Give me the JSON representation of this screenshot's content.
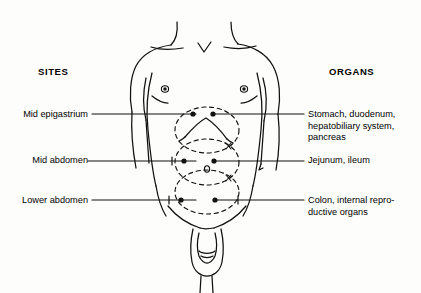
{
  "diagram": {
    "title_left": "SITES",
    "title_right": "ORGANS",
    "rows": [
      {
        "site": "Mid epigastrium",
        "organs": "Stomach, duodenum, hepatobiliary system, pancreas",
        "organs_lines": [
          "Stomach, duodenum,",
          "hepatobiliary system,",
          "pancreas"
        ]
      },
      {
        "site": "Mid abdomen",
        "organs": "Jejunum, ileum",
        "organs_lines": [
          "Jejunum, ileum"
        ]
      },
      {
        "site": "Lower abdomen",
        "organs": "Colon, internal reproductive organs",
        "organs_lines": [
          "Colon, internal repro-",
          "ductive organs"
        ]
      }
    ],
    "markers": {
      "navel_glyph": "o",
      "site_dot_count_per_row": 2
    },
    "colors": {
      "ink": "#000000",
      "background": "#fdfdfc"
    }
  }
}
